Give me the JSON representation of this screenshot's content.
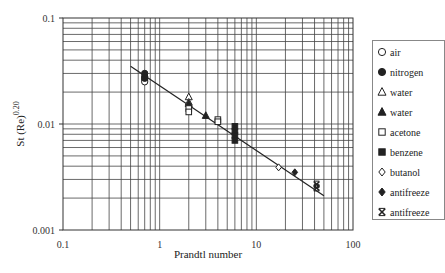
{
  "chart_data": {
    "type": "scatter",
    "title": "",
    "xlabel": "Prandtl number",
    "ylabel": "St (Re)^0.20",
    "ylabel_base": "St (Re)",
    "ylabel_exp": "0.20",
    "xscale": "log",
    "yscale": "log",
    "xlim": [
      0.1,
      100
    ],
    "ylim": [
      0.001,
      0.1
    ],
    "x_ticks": [
      "0.1",
      "1",
      "10",
      "100"
    ],
    "y_ticks": [
      "0.1",
      "0.01",
      "0.001"
    ],
    "grid": true,
    "legend_position": "right",
    "series": [
      {
        "name": "air",
        "marker": "open-circle",
        "points": [
          [
            0.7,
            0.026
          ],
          [
            0.7,
            0.025
          ]
        ]
      },
      {
        "name": "nitrogen",
        "marker": "filled-circle",
        "points": [
          [
            0.7,
            0.028
          ],
          [
            0.7,
            0.027
          ]
        ]
      },
      {
        "name": "water",
        "marker": "open-triangle",
        "points": [
          [
            2.0,
            0.018
          ],
          [
            2.0,
            0.016
          ]
        ]
      },
      {
        "name": "water",
        "marker": "filled-triangle",
        "points": [
          [
            2.0,
            0.0155
          ],
          [
            3.0,
            0.012
          ]
        ]
      },
      {
        "name": "acetone",
        "marker": "open-square",
        "points": [
          [
            2.0,
            0.014
          ],
          [
            2.0,
            0.013
          ],
          [
            4.0,
            0.011
          ],
          [
            4.0,
            0.0105
          ]
        ]
      },
      {
        "name": "benzene",
        "marker": "filled-square",
        "points": [
          [
            6.0,
            0.0095
          ],
          [
            6.0,
            0.0085
          ],
          [
            6.0,
            0.0078
          ],
          [
            6.0,
            0.007
          ]
        ]
      },
      {
        "name": "butanol",
        "marker": "open-diamond",
        "points": [
          [
            17.0,
            0.0039
          ]
        ]
      },
      {
        "name": "antifreeze",
        "marker": "filled-diamond",
        "points": [
          [
            25.0,
            0.0035
          ]
        ]
      },
      {
        "name": "antifreeze",
        "marker": "x-cross",
        "points": [
          [
            42.0,
            0.0027
          ],
          [
            42.0,
            0.0025
          ]
        ]
      },
      {
        "name": "nitrogen-extra",
        "marker": "filled-circle",
        "points": [
          [
            0.7,
            0.03
          ]
        ]
      }
    ],
    "fit_line": {
      "x": [
        0.5,
        50
      ],
      "y": [
        0.035,
        0.0021
      ]
    }
  },
  "legend": {
    "items": [
      {
        "label": "air",
        "marker": "open-circle"
      },
      {
        "label": "nitrogen",
        "marker": "filled-circle"
      },
      {
        "label": "water",
        "marker": "open-triangle"
      },
      {
        "label": "water",
        "marker": "filled-triangle"
      },
      {
        "label": "acetone",
        "marker": "open-square"
      },
      {
        "label": "benzene",
        "marker": "filled-square"
      },
      {
        "label": "butanol",
        "marker": "open-diamond"
      },
      {
        "label": "antifreeze",
        "marker": "filled-diamond"
      },
      {
        "label": "antifreeze",
        "marker": "x-cross"
      }
    ]
  },
  "colors": {
    "line": "#222222",
    "grid": "#333333",
    "marker": "#222222"
  }
}
